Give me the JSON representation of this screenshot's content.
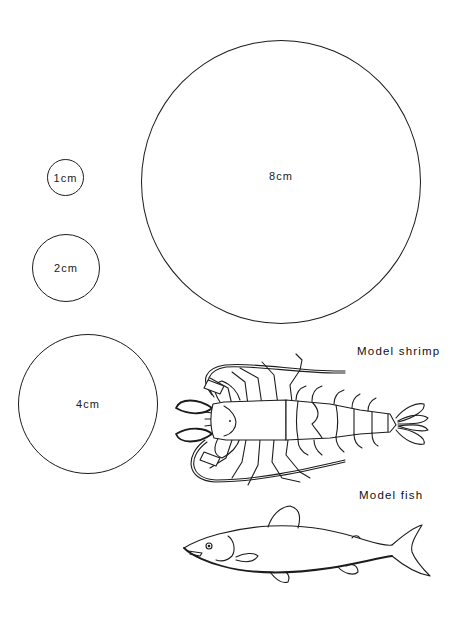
{
  "figure": {
    "background": "#ffffff",
    "stroke_color": "#1c1c1c"
  },
  "scale_circles": [
    {
      "label": "1cm",
      "center_x": 66,
      "center_y": 177,
      "diameter": 37
    },
    {
      "label": "2cm",
      "center_x": 66,
      "center_y": 268,
      "diameter": 68
    },
    {
      "label": "4cm",
      "center_x": 87,
      "center_y": 404,
      "diameter": 140
    },
    {
      "label": "8cm",
      "center_x": 280,
      "center_y": 181,
      "diameter": 280
    }
  ],
  "models": {
    "shrimp": {
      "caption": "Model shrimp",
      "icon": "shrimp-illustration"
    },
    "fish": {
      "caption": "Model fish",
      "icon": "fish-illustration"
    }
  }
}
